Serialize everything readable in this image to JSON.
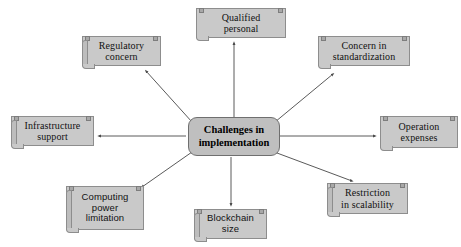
{
  "diagram": {
    "type": "radial-mind-map",
    "center": {
      "id": "center",
      "label": "Challenges in implementation",
      "line1": "Challenges in",
      "line2": "implementation",
      "fill": "#bfbfbf",
      "border": "#6f6f6f"
    },
    "node_fill": "#c9c9c9",
    "node_border": "#8d8d8d",
    "connector_color": "#5a5a5a",
    "background": "#ffffff",
    "nodes": [
      {
        "id": "qualified-personal",
        "label": "Qualified personal",
        "line1": "Qualified",
        "line2": "personal",
        "position": "top",
        "font": "serif",
        "x": 196,
        "y": 8,
        "w": 90,
        "h": 30
      },
      {
        "id": "regulatory-concern",
        "label": "Regulatory concern",
        "line1": "Regulatory",
        "line2": "concern",
        "position": "top-left",
        "font": "serif",
        "x": 82,
        "y": 36,
        "w": 79,
        "h": 30
      },
      {
        "id": "concern-in-standardization",
        "label": "Concern in standardization",
        "line1": "Concern in",
        "line2": "standardization",
        "position": "top-right",
        "font": "serif",
        "x": 318,
        "y": 36,
        "w": 92,
        "h": 30
      },
      {
        "id": "infrastructure-support",
        "label": "Infrastructure support",
        "line1": "Infrastructure",
        "line2": "support",
        "position": "left",
        "font": "serif",
        "x": 11,
        "y": 116,
        "w": 83,
        "h": 30
      },
      {
        "id": "operation-expenses",
        "label": "Operation expenses",
        "line1": "Operation",
        "line2": "expenses",
        "position": "right",
        "font": "serif",
        "x": 380,
        "y": 116,
        "w": 78,
        "h": 32
      },
      {
        "id": "computing-power-limitation",
        "label": "Computing power limitation",
        "line1": "Computing",
        "line2": "power",
        "line3": "limitation",
        "position": "bottom-left",
        "font": "sans",
        "x": 66,
        "y": 186,
        "w": 78,
        "h": 44
      },
      {
        "id": "blockchain-size",
        "label": "Blockchain size",
        "line1": "Blockchain",
        "line2": "size",
        "position": "bottom",
        "font": "sans",
        "x": 194,
        "y": 209,
        "w": 73,
        "h": 30
      },
      {
        "id": "restriction-in-scalability",
        "label": "Restriction in scalability",
        "line1": "Restriction",
        "line2": "in scalability",
        "position": "bottom-right",
        "font": "serif",
        "x": 327,
        "y": 183,
        "w": 81,
        "h": 31
      }
    ],
    "connectors": [
      {
        "id": "to-qualified-personal",
        "from": "center",
        "to": "qualified-personal",
        "arrow": "outward"
      },
      {
        "id": "to-regulatory-concern",
        "from": "center",
        "to": "regulatory-concern",
        "arrow": "outward"
      },
      {
        "id": "to-concern-in-standardization",
        "from": "center",
        "to": "concern-in-standardization",
        "arrow": "outward"
      },
      {
        "id": "to-infrastructure-support",
        "from": "center",
        "to": "infrastructure-support",
        "arrow": "outward"
      },
      {
        "id": "to-operation-expenses",
        "from": "center",
        "to": "operation-expenses",
        "arrow": "outward"
      },
      {
        "id": "to-computing-power-limitation",
        "from": "center",
        "to": "computing-power-limitation",
        "arrow": "outward"
      },
      {
        "id": "to-blockchain-size",
        "from": "center",
        "to": "blockchain-size",
        "arrow": "outward"
      },
      {
        "id": "to-restriction-in-scalability",
        "from": "center",
        "to": "restriction-in-scalability",
        "arrow": "outward"
      }
    ]
  }
}
